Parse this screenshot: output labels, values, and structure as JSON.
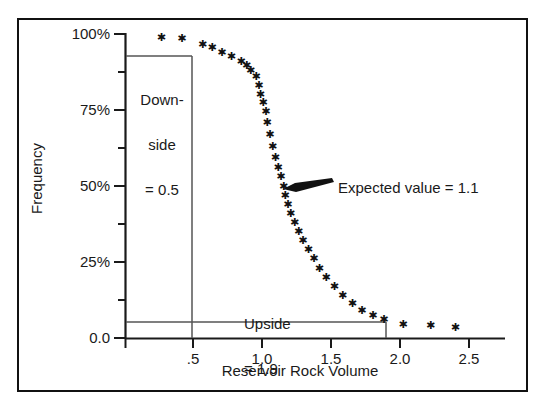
{
  "chart_data": {
    "type": "scatter",
    "title": "",
    "xlabel": "Reservoir Rock Volume",
    "ylabel": "Frequency",
    "xlim": [
      0,
      2.75
    ],
    "ylim": [
      0,
      100
    ],
    "grid": false,
    "legend": null,
    "x_ticks": [
      0.5,
      1.0,
      1.5,
      2.0,
      2.5
    ],
    "x_tick_labels": [
      ".5",
      "1.0",
      "1.5",
      "2.0",
      "2.5"
    ],
    "x_minor_ticks": [],
    "y_ticks": [
      0,
      12.5,
      25,
      37.5,
      50,
      62.5,
      75,
      87.5,
      100
    ],
    "y_tick_labels": [
      "0.0",
      "",
      "25%",
      "",
      "50%",
      "",
      "75%",
      "",
      "100%"
    ],
    "series": [
      {
        "name": "Cumulative frequency (reverse)",
        "marker": "star",
        "points": [
          [
            0.26,
            99.0
          ],
          [
            0.41,
            98.5
          ],
          [
            0.56,
            96.5
          ],
          [
            0.63,
            95.5
          ],
          [
            0.7,
            94.0
          ],
          [
            0.77,
            92.5
          ],
          [
            0.84,
            91.0
          ],
          [
            0.88,
            89.5
          ],
          [
            0.91,
            88.0
          ],
          [
            0.95,
            86.0
          ],
          [
            0.97,
            83.0
          ],
          [
            0.98,
            80.0
          ],
          [
            1.0,
            77.5
          ],
          [
            1.02,
            74.5
          ],
          [
            1.03,
            71.0
          ],
          [
            1.05,
            67.0
          ],
          [
            1.07,
            63.0
          ],
          [
            1.09,
            59.5
          ],
          [
            1.11,
            56.0
          ],
          [
            1.13,
            53.0
          ],
          [
            1.15,
            50.0
          ],
          [
            1.16,
            47.0
          ],
          [
            1.18,
            44.0
          ],
          [
            1.2,
            41.0
          ],
          [
            1.23,
            38.0
          ],
          [
            1.26,
            35.0
          ],
          [
            1.29,
            32.0
          ],
          [
            1.33,
            29.0
          ],
          [
            1.37,
            26.0
          ],
          [
            1.41,
            23.0
          ],
          [
            1.46,
            20.0
          ],
          [
            1.52,
            17.0
          ],
          [
            1.58,
            14.0
          ],
          [
            1.65,
            11.5
          ],
          [
            1.72,
            9.0
          ],
          [
            1.8,
            7.5
          ],
          [
            1.88,
            6.0
          ],
          [
            2.02,
            4.5
          ],
          [
            2.22,
            4.0
          ],
          [
            2.4,
            3.5
          ]
        ]
      }
    ],
    "annotations": [
      {
        "name": "downside-box",
        "label": "Downside\n= 0.5",
        "text_lines": [
          "Down-",
          "side",
          "= 0.5"
        ],
        "x_value": 0.5,
        "y_value": 95,
        "kind": "vertical-box-from-axis"
      },
      {
        "name": "upside-box",
        "label": "Upside\n= 1.9",
        "text_lines": [
          "Upside",
          "= 1.9"
        ],
        "x_value": 1.9,
        "y_value": 5,
        "kind": "horizontal-box-from-axis"
      },
      {
        "name": "expected-value-arrow",
        "label": "Expected value = 1.1",
        "x_value": 1.15,
        "y_value": 50,
        "kind": "arrow-pointer"
      }
    ],
    "colors": {
      "marker": "#111111",
      "axis": "#1a1a1a",
      "annotation_line": "#555555",
      "frame": "#111111",
      "background": "#ffffff"
    }
  },
  "axes": {
    "y_label": "Frequency",
    "x_label": "Reservoir Rock Volume",
    "y_tick_100": "100%",
    "y_tick_75": "75%",
    "y_tick_50": "50%",
    "y_tick_25": "25%",
    "y_tick_0": "0.0",
    "x_tick_05": ".5",
    "x_tick_10": "1.0",
    "x_tick_15": "1.5",
    "x_tick_20": "2.0",
    "x_tick_25": "2.5"
  },
  "annotations": {
    "downside_line1": "Down-",
    "downside_line2": "side",
    "downside_line3": "= 0.5",
    "upside_line1": "Upside",
    "upside_line2": "= 1.9",
    "expected": "Expected value = 1.1"
  }
}
